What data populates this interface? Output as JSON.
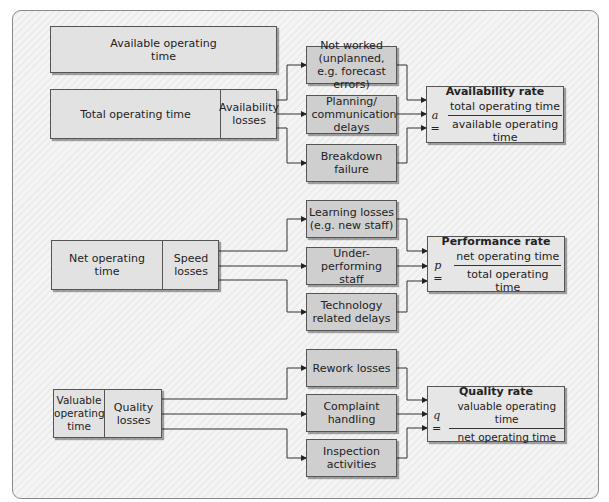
{
  "diagram": {
    "sections": [
      {
        "name": "availability",
        "available_box": "Available operating time",
        "main_box": "Total operating time",
        "loss_box": "Availability losses",
        "losses": [
          "Not worked (unplanned, e.g. forecast errors)",
          "Planning/ communication delays",
          "Breakdown failure"
        ],
        "rate": {
          "title": "Availability rate",
          "variable": "a =",
          "numerator": "total operating time",
          "denominator": "available operating time"
        }
      },
      {
        "name": "performance",
        "main_box": "Net operating time",
        "loss_box": "Speed losses",
        "losses": [
          "Learning losses (e.g. new staff)",
          "Under-performing staff",
          "Technology related delays"
        ],
        "rate": {
          "title": "Performance rate",
          "variable": "p =",
          "numerator": "net operating time",
          "denominator": "total operating time"
        }
      },
      {
        "name": "quality",
        "main_box": "Valuable operating time",
        "loss_box": "Quality losses",
        "losses": [
          "Rework losses",
          "Complaint handling",
          "Inspection activities"
        ],
        "rate": {
          "title": "Quality rate",
          "variable": "q =",
          "numerator": "valuable operating time",
          "denominator": "net operating time"
        }
      }
    ],
    "colors": {
      "box_dark": "#cfcfcf",
      "box_light": "#e2e2e2",
      "line": "#333333",
      "background": "#f2f2f2"
    }
  }
}
